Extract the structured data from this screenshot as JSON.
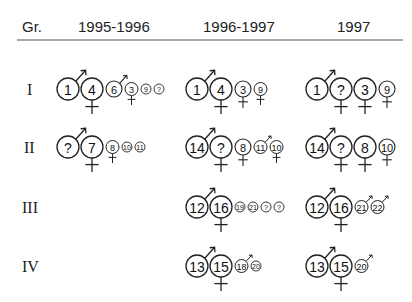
{
  "header": {
    "group_label": "Gr.",
    "periods": [
      "1995-1996",
      "1996-1997",
      "1997"
    ]
  },
  "groups": [
    {
      "label": "I",
      "cells": [
        [
          {
            "id": "1",
            "size": "L",
            "sex": "male"
          },
          {
            "id": "4",
            "size": "L",
            "sex": "female"
          },
          {
            "id": "6",
            "size": "M",
            "sex": "male"
          },
          {
            "id": "3",
            "size": "S",
            "sex": "female"
          },
          {
            "id": "9",
            "size": "XS",
            "sex": ""
          },
          {
            "id": "?",
            "size": "XS",
            "sex": ""
          }
        ],
        [
          {
            "id": "1",
            "size": "L",
            "sex": "male"
          },
          {
            "id": "4",
            "size": "L",
            "sex": "female"
          },
          {
            "id": "3",
            "size": "M",
            "sex": "female"
          },
          {
            "id": "9",
            "size": "S",
            "sex": "female"
          }
        ],
        [
          {
            "id": "1",
            "size": "L",
            "sex": "male"
          },
          {
            "id": "?",
            "size": "L",
            "sex": "female"
          },
          {
            "id": "3",
            "size": "L",
            "sex": "female"
          },
          {
            "id": "9",
            "size": "M",
            "sex": "female"
          }
        ]
      ]
    },
    {
      "label": "II",
      "cells": [
        [
          {
            "id": "?",
            "size": "L",
            "sex": "male"
          },
          {
            "id": "7",
            "size": "L",
            "sex": "female"
          },
          {
            "id": "8",
            "size": "S",
            "sex": "female"
          },
          {
            "id": "10",
            "size": "XS",
            "sex": ""
          },
          {
            "id": "11",
            "size": "XS",
            "sex": ""
          }
        ],
        [
          {
            "id": "14",
            "size": "L",
            "sex": "male"
          },
          {
            "id": "?",
            "size": "L",
            "sex": "female"
          },
          {
            "id": "8",
            "size": "M",
            "sex": "female"
          },
          {
            "id": "11",
            "size": "S",
            "sex": "male"
          },
          {
            "id": "10",
            "size": "S",
            "sex": "female"
          }
        ],
        [
          {
            "id": "14",
            "size": "L",
            "sex": "male"
          },
          {
            "id": "?",
            "size": "L",
            "sex": "female"
          },
          {
            "id": "8",
            "size": "L",
            "sex": "female"
          },
          {
            "id": "10",
            "size": "M",
            "sex": "female"
          }
        ]
      ]
    },
    {
      "label": "III",
      "cells": [
        [],
        [
          {
            "id": "12",
            "size": "L",
            "sex": "male"
          },
          {
            "id": "16",
            "size": "L",
            "sex": "female"
          },
          {
            "id": "19",
            "size": "XS",
            "sex": ""
          },
          {
            "id": "21",
            "size": "XS",
            "sex": ""
          },
          {
            "id": "?",
            "size": "XS",
            "sex": ""
          },
          {
            "id": "?",
            "size": "XS",
            "sex": ""
          }
        ],
        [
          {
            "id": "12",
            "size": "L",
            "sex": "male"
          },
          {
            "id": "16",
            "size": "L",
            "sex": "female"
          },
          {
            "id": "21",
            "size": "S",
            "sex": "male"
          },
          {
            "id": "22",
            "size": "S",
            "sex": "male"
          }
        ]
      ]
    },
    {
      "label": "IV",
      "cells": [
        [],
        [
          {
            "id": "13",
            "size": "L",
            "sex": "male"
          },
          {
            "id": "15",
            "size": "L",
            "sex": "female"
          },
          {
            "id": "18",
            "size": "S",
            "sex": "male"
          },
          {
            "id": "20",
            "size": "XS",
            "sex": ""
          }
        ],
        [
          {
            "id": "13",
            "size": "L",
            "sex": "male"
          },
          {
            "id": "15",
            "size": "L",
            "sex": "female"
          },
          {
            "id": "20",
            "size": "S",
            "sex": "male"
          }
        ]
      ]
    }
  ],
  "colors": {
    "ink": "#222222",
    "rule": "#555555",
    "background": "#ffffff"
  }
}
